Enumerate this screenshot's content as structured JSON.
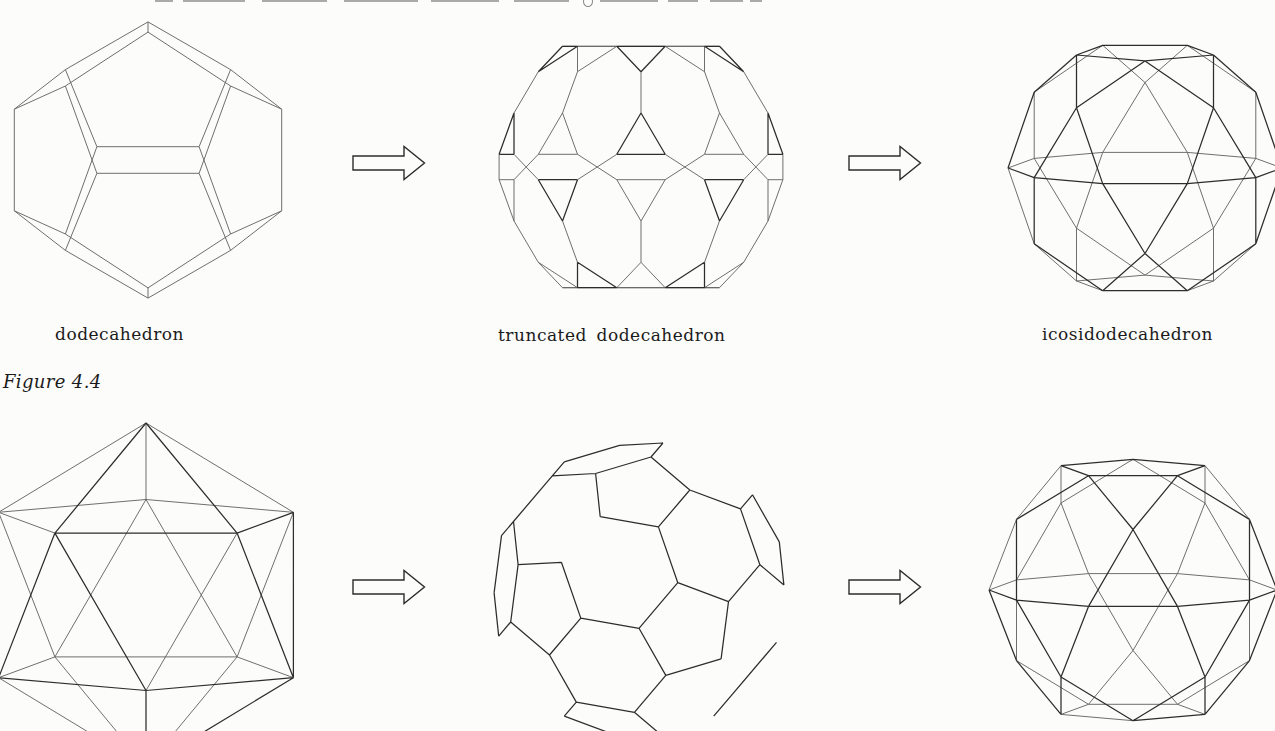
{
  "caption": {
    "text": "Figure 4.4"
  },
  "colors": {
    "background": "#fcfcfa",
    "line": "#2d2d2d",
    "hidden_line": "#5f5f5f",
    "text": "#1b1b1b"
  },
  "top_row": {
    "shapes": [
      {
        "name": "dodecahedron",
        "label": "dodecahedron"
      },
      {
        "name": "truncated-dodecahedron",
        "label": "truncated dodecahedron"
      },
      {
        "name": "icosidodecahedron",
        "label": "icosidodecahedron"
      }
    ]
  },
  "bottom_row": {
    "shapes": [
      {
        "name": "icosahedron"
      },
      {
        "name": "truncated-icosahedron"
      },
      {
        "name": "icosidodecahedron"
      }
    ]
  }
}
